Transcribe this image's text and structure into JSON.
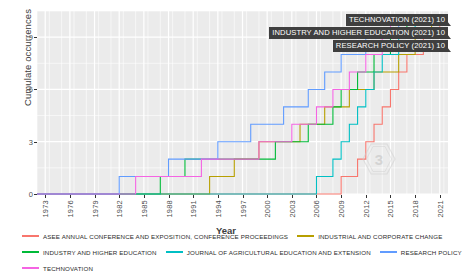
{
  "chart_data": {
    "type": "line",
    "title": "",
    "xlabel": "Year",
    "ylabel": "Cumulate occurrences",
    "xlim": [
      1972,
      2022
    ],
    "ylim": [
      0,
      10.5
    ],
    "grid": true,
    "legend_position": "bottom",
    "step": true,
    "x_ticks": [
      "1973",
      "1976",
      "1979",
      "1982",
      "1985",
      "1988",
      "1991",
      "1994",
      "1997",
      "2000",
      "2003",
      "2006",
      "2009",
      "2012",
      "2015",
      "2018",
      "2021"
    ],
    "y_ticks": [
      "0",
      "3",
      "6",
      "9"
    ],
    "series": [
      {
        "name": "ASEE ANNUAL CONFERENCE AND EXPOSITION, CONFERENCE PROCEEDINGS",
        "color": "#f8766d",
        "points": [
          [
            1972,
            0
          ],
          [
            2009,
            0
          ],
          [
            2009,
            1
          ],
          [
            2011,
            1
          ],
          [
            2011,
            2
          ],
          [
            2012,
            2
          ],
          [
            2012,
            3
          ],
          [
            2013,
            3
          ],
          [
            2013,
            4
          ],
          [
            2014,
            4
          ],
          [
            2014,
            5
          ],
          [
            2015,
            5
          ],
          [
            2015,
            6
          ],
          [
            2016,
            6
          ],
          [
            2016,
            7
          ],
          [
            2017,
            7
          ],
          [
            2017,
            8
          ],
          [
            2019,
            8
          ],
          [
            2019,
            9
          ],
          [
            2021,
            9
          ],
          [
            2021,
            10
          ],
          [
            2022,
            10
          ]
        ]
      },
      {
        "name": "INDUSTRIAL AND CORPORATE CHANGE",
        "color": "#b79f00",
        "points": [
          [
            1972,
            0
          ],
          [
            1993,
            0
          ],
          [
            1993,
            1
          ],
          [
            1996,
            1
          ],
          [
            1996,
            2
          ],
          [
            1999,
            2
          ],
          [
            1999,
            3
          ],
          [
            2004,
            3
          ],
          [
            2004,
            4
          ],
          [
            2007,
            4
          ],
          [
            2007,
            5
          ],
          [
            2010,
            5
          ],
          [
            2010,
            6
          ],
          [
            2013,
            6
          ],
          [
            2013,
            7
          ],
          [
            2016,
            7
          ],
          [
            2016,
            8
          ],
          [
            2018,
            8
          ],
          [
            2018,
            9
          ],
          [
            2020,
            9
          ],
          [
            2020,
            10
          ],
          [
            2022,
            10
          ]
        ]
      },
      {
        "name": "INDUSTRY AND HIGHER EDUCATION",
        "color": "#00ba38",
        "points": [
          [
            1972,
            0
          ],
          [
            1987,
            0
          ],
          [
            1987,
            1
          ],
          [
            1990,
            1
          ],
          [
            1990,
            2
          ],
          [
            2001,
            2
          ],
          [
            2001,
            3
          ],
          [
            2005,
            3
          ],
          [
            2005,
            4
          ],
          [
            2008,
            4
          ],
          [
            2008,
            5
          ],
          [
            2009,
            5
          ],
          [
            2009,
            6
          ],
          [
            2011,
            6
          ],
          [
            2011,
            7
          ],
          [
            2013,
            7
          ],
          [
            2013,
            8
          ],
          [
            2015,
            8
          ],
          [
            2015,
            9
          ],
          [
            2017,
            9
          ],
          [
            2017,
            10
          ],
          [
            2022,
            10
          ]
        ]
      },
      {
        "name": "JOURNAL OF AGRICULTURAL EDUCATION AND EXTENSION",
        "color": "#00bfc4",
        "points": [
          [
            1972,
            0
          ],
          [
            2006,
            0
          ],
          [
            2006,
            1
          ],
          [
            2008,
            1
          ],
          [
            2008,
            2
          ],
          [
            2009,
            2
          ],
          [
            2009,
            3
          ],
          [
            2010,
            3
          ],
          [
            2010,
            4
          ],
          [
            2011,
            4
          ],
          [
            2011,
            5
          ],
          [
            2012,
            5
          ],
          [
            2012,
            6
          ],
          [
            2013,
            6
          ],
          [
            2013,
            7
          ],
          [
            2014,
            7
          ],
          [
            2014,
            8
          ],
          [
            2016,
            8
          ],
          [
            2016,
            9
          ],
          [
            2018,
            9
          ],
          [
            2018,
            10
          ],
          [
            2022,
            10
          ]
        ]
      },
      {
        "name": "RESEARCH POLICY",
        "color": "#619cff",
        "points": [
          [
            1972,
            0
          ],
          [
            1982,
            0
          ],
          [
            1982,
            1
          ],
          [
            1988,
            1
          ],
          [
            1988,
            2
          ],
          [
            1994,
            2
          ],
          [
            1994,
            3
          ],
          [
            1998,
            3
          ],
          [
            1998,
            4
          ],
          [
            2002,
            4
          ],
          [
            2002,
            5
          ],
          [
            2005,
            5
          ],
          [
            2005,
            6
          ],
          [
            2007,
            6
          ],
          [
            2007,
            7
          ],
          [
            2009,
            7
          ],
          [
            2009,
            8
          ],
          [
            2012,
            8
          ],
          [
            2012,
            9
          ],
          [
            2016,
            9
          ],
          [
            2016,
            10
          ],
          [
            2022,
            10
          ]
        ]
      },
      {
        "name": "TECHNOVATION",
        "color": "#f564e3",
        "points": [
          [
            1972,
            0
          ],
          [
            1984,
            0
          ],
          [
            1984,
            1
          ],
          [
            1992,
            1
          ],
          [
            1992,
            2
          ],
          [
            1999,
            2
          ],
          [
            1999,
            3
          ],
          [
            2003,
            3
          ],
          [
            2003,
            4
          ],
          [
            2006,
            4
          ],
          [
            2006,
            5
          ],
          [
            2008,
            5
          ],
          [
            2008,
            6
          ],
          [
            2010,
            6
          ],
          [
            2010,
            7
          ],
          [
            2012,
            7
          ],
          [
            2012,
            8
          ],
          [
            2014,
            8
          ],
          [
            2014,
            9
          ],
          [
            2015,
            9
          ],
          [
            2015,
            10
          ],
          [
            2022,
            10
          ]
        ]
      }
    ],
    "annotations": [
      {
        "text": "TECHNOVATION (2021) 10"
      },
      {
        "text": "INDUSTRY AND HIGHER EDUCATION (2021) 10"
      },
      {
        "text": "RESEARCH POLICY (2021) 10"
      }
    ]
  },
  "legend": {
    "rows": [
      [
        {
          "label": "ASEE ANNUAL CONFERENCE AND EXPOSITION, CONFERENCE PROCEEDINGS",
          "color": "#f8766d"
        },
        {
          "label": "INDUSTRIAL AND CORPORATE CHANGE",
          "color": "#b79f00"
        }
      ],
      [
        {
          "label": "INDUSTRY AND HIGHER EDUCATION",
          "color": "#00ba38"
        },
        {
          "label": "JOURNAL OF AGRICULTURAL EDUCATION AND EXTENSION",
          "color": "#00bfc4"
        },
        {
          "label": "RESEARCH POLICY",
          "color": "#619cff"
        }
      ],
      [
        {
          "label": "TECHNOVATION",
          "color": "#f564e3"
        }
      ]
    ]
  },
  "watermark": {
    "name": "hexagon-watermark"
  },
  "colors": {
    "panel_background": "#ebebeb",
    "gridline": "#ffffff",
    "label_box": "#3f3f3f",
    "text": "#4d4d4d"
  }
}
